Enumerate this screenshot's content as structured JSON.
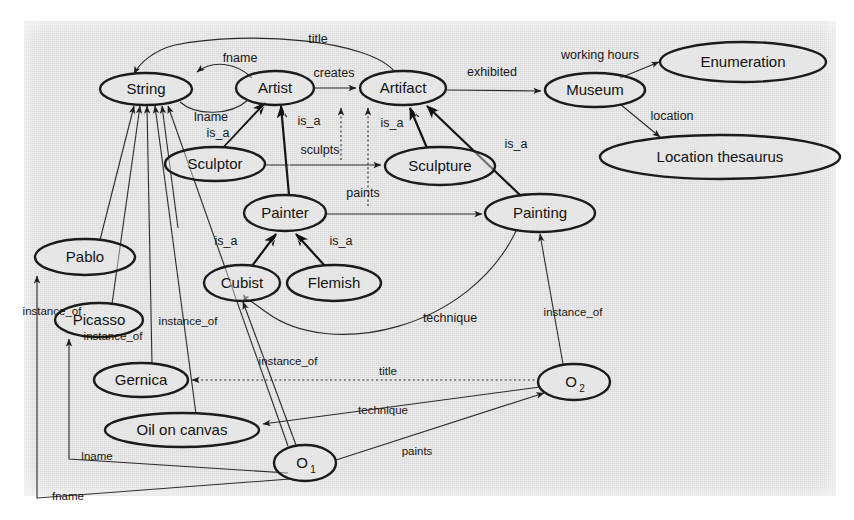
{
  "figure": {
    "kind": "semantic-network-diagram",
    "background_color": "#ececec",
    "node_fill": "#e8e8e8",
    "stroke_color": "#1b1b1b"
  },
  "nodes": [
    {
      "id": "string",
      "label": "String",
      "cx": 146,
      "cy": 89,
      "rx": 46,
      "ry": 16
    },
    {
      "id": "artist",
      "label": "Artist",
      "cx": 275,
      "cy": 88,
      "rx": 39,
      "ry": 17
    },
    {
      "id": "artifact",
      "label": "Artifact",
      "cx": 403,
      "cy": 88,
      "rx": 43,
      "ry": 17
    },
    {
      "id": "museum",
      "label": "Museum",
      "cx": 595,
      "cy": 90,
      "rx": 50,
      "ry": 17
    },
    {
      "id": "enumeration",
      "label": "Enumeration",
      "cx": 743,
      "cy": 62,
      "rx": 83,
      "ry": 20
    },
    {
      "id": "location",
      "label": "Location thesaurus",
      "cx": 720,
      "cy": 157,
      "rx": 120,
      "ry": 22
    },
    {
      "id": "sculptor",
      "label": "Sculptor",
      "cx": 215,
      "cy": 164,
      "rx": 50,
      "ry": 17
    },
    {
      "id": "sculpture",
      "label": "Sculpture",
      "cx": 440,
      "cy": 166,
      "rx": 55,
      "ry": 19
    },
    {
      "id": "painter",
      "label": "Painter",
      "cx": 285,
      "cy": 213,
      "rx": 41,
      "ry": 18
    },
    {
      "id": "painting",
      "label": "Painting",
      "cx": 540,
      "cy": 213,
      "rx": 55,
      "ry": 19
    },
    {
      "id": "cubist",
      "label": "Cubist",
      "cx": 242,
      "cy": 283,
      "rx": 38,
      "ry": 18
    },
    {
      "id": "flemish",
      "label": "Flemish",
      "cx": 334,
      "cy": 283,
      "rx": 47,
      "ry": 18
    },
    {
      "id": "pablo",
      "label": "Pablo",
      "cx": 85,
      "cy": 257,
      "rx": 50,
      "ry": 18
    },
    {
      "id": "picasso",
      "label": "Picasso",
      "cx": 99,
      "cy": 320,
      "rx": 44,
      "ry": 17
    },
    {
      "id": "gernica",
      "label": "Gernica",
      "cx": 141,
      "cy": 380,
      "rx": 47,
      "ry": 17
    },
    {
      "id": "oil",
      "label": "Oil on canvas",
      "cx": 182,
      "cy": 430,
      "rx": 77,
      "ry": 17
    },
    {
      "id": "o1",
      "label": "O",
      "sub": "1",
      "cx": 305,
      "cy": 463,
      "rx": 31,
      "ry": 18
    },
    {
      "id": "o2",
      "label": "O",
      "sub": "2",
      "cx": 574,
      "cy": 382,
      "rx": 36,
      "ry": 18
    }
  ],
  "edge_labels": {
    "title_top": "title",
    "fname_top": "fname",
    "lname_top": "lname",
    "creates": "creates",
    "exhibited": "exhibited",
    "working_hours": "working hours",
    "location": "location",
    "is_a_sculptor": "is_a",
    "is_a_painter": "is_a",
    "is_a_sculpture": "is_a",
    "is_a_painting": "is_a",
    "is_a_cubist": "is_a",
    "is_a_flemish": "is_a",
    "sculpts": "sculpts",
    "paints": "paints",
    "technique_upper": "technique",
    "technique_lower": "technique",
    "instance_of_pablo": "instance_of",
    "instance_of_picasso": "instance_of",
    "instance_of_cubist": "instance_of",
    "instance_of_o1": "instance_of",
    "instance_of_o2": "instance_of",
    "title_o2": "title",
    "paints_o1": "paints",
    "lname_bottom": "lname",
    "fname_bottom": "fname"
  }
}
